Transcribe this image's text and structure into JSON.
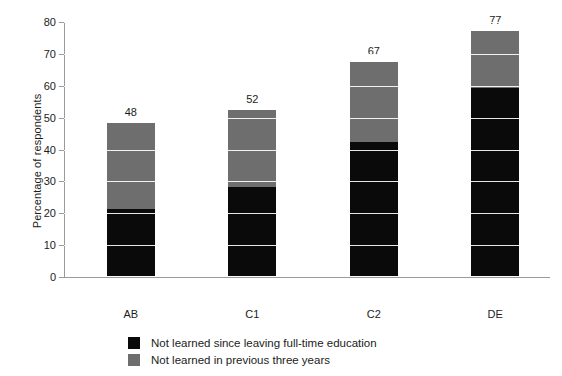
{
  "chart_data": {
    "type": "bar",
    "subtype": "stacked-bar",
    "title": "",
    "xlabel": "",
    "ylabel": "Percentage of respondents",
    "categories": [
      "AB",
      "C1",
      "C2",
      "DE"
    ],
    "totals": [
      48,
      52,
      67,
      77
    ],
    "ylim": [
      0,
      80
    ],
    "yticks": [
      0,
      10,
      20,
      30,
      40,
      50,
      60,
      70,
      80
    ],
    "ytick_labels": [
      "0",
      "10",
      "20",
      "30",
      "40",
      "50",
      "60",
      "70",
      "80"
    ],
    "grid": "horizontal-white-over-bars",
    "legend_position": "bottom-center",
    "series": [
      {
        "name": "Not learned since leaving full-time education",
        "color": "#0a0a0a",
        "values": [
          21,
          28,
          42,
          59
        ]
      },
      {
        "name": "Not learned in previous three years",
        "color": "#6e6e6e",
        "values": [
          27,
          24,
          25,
          18
        ]
      }
    ],
    "data_labels": [
      "48",
      "52",
      "67",
      "77"
    ]
  },
  "axis": {
    "y_title": "Percentage of respondents"
  },
  "legend": {
    "items": [
      {
        "label": "Not learned since leaving full-time education",
        "color": "#0a0a0a"
      },
      {
        "label": "Not learned in previous three years",
        "color": "#6e6e6e"
      }
    ]
  }
}
